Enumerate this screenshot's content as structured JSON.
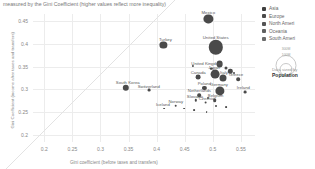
{
  "subtitle": "measured by the Gini Coefficient (higher values reflect more inequality)",
  "axes": {
    "xlabel": "Gini coefficient (before taxes and transfers)",
    "ylabel": "Gini Coefficient (income after taxes and transfers)",
    "xticks": [
      "0.2",
      "0.25",
      "0.3",
      "0.35",
      "0.4",
      "0.45",
      "0.5",
      "0.55"
    ],
    "yticks": [
      "0.2",
      "0.25",
      "0.3",
      "0.35",
      "0.4",
      "0.45"
    ],
    "xlim": [
      0.18,
      0.575
    ],
    "ylim": [
      0.185,
      0.465
    ]
  },
  "legend": {
    "title": "",
    "items": [
      {
        "label": "Asia",
        "color": "#3f3f3f"
      },
      {
        "label": "Europe",
        "color": "#4a4a4a"
      },
      {
        "label": "North Ameri",
        "color": "#555555"
      },
      {
        "label": "Oceania",
        "color": "#606060"
      },
      {
        "label": "South Ameri",
        "color": "#6b6b6b"
      }
    ],
    "size_caption_1": "Data sized by",
    "size_caption_2": "Population",
    "size_values": [
      "300M",
      "100M"
    ]
  },
  "chart_data": {
    "type": "scatter",
    "title": "",
    "subtitle": "measured by the Gini Coefficient (higher values reflect more inequality)",
    "xlabel": "Gini coefficient (before taxes and transfers)",
    "ylabel": "Gini Coefficient (income after taxes and transfers)",
    "xlim": [
      0.18,
      0.575
    ],
    "ylim": [
      0.185,
      0.465
    ],
    "grid": true,
    "size_encodes": "Population",
    "reference_line": "y = x diagonal",
    "points": [
      {
        "name": "Mexico",
        "x": 0.492,
        "y": 0.455,
        "r": 4.6,
        "lx": 0,
        "ly": -6.5
      },
      {
        "name": "United States",
        "x": 0.505,
        "y": 0.392,
        "r": 7.2,
        "lx": 0,
        "ly": -10.5
      },
      {
        "name": "Turkey",
        "x": 0.412,
        "y": 0.397,
        "r": 3.6,
        "lx": 2,
        "ly": -6
      },
      {
        "name": "United Kingdom",
        "x": 0.512,
        "y": 0.355,
        "r": 3.4,
        "lx": -13,
        "ly": -1.5
      },
      {
        "name": "Japan",
        "x": 0.504,
        "y": 0.334,
        "r": 4.4,
        "lx": -1,
        "ly": -6.5
      },
      {
        "name": "Italy",
        "x": 0.518,
        "y": 0.326,
        "r": 3.5,
        "lx": 1,
        "ly": -5.5
      },
      {
        "name": "Canada",
        "x": 0.474,
        "y": 0.327,
        "r": 2.4,
        "lx": 0,
        "ly": -5
      },
      {
        "name": "South Korea",
        "x": 0.345,
        "y": 0.304,
        "r": 3.2,
        "lx": 2,
        "ly": -5.5
      },
      {
        "name": "Switzerland",
        "x": 0.386,
        "y": 0.298,
        "r": 1.4,
        "lx": 0,
        "ly": -4.5
      },
      {
        "name": "Poland",
        "x": 0.485,
        "y": 0.303,
        "r": 2.1,
        "lx": 0,
        "ly": -5
      },
      {
        "name": "Germany",
        "x": 0.513,
        "y": 0.297,
        "r": 4.6,
        "lx": -1,
        "ly": -7
      },
      {
        "name": "Netherlands",
        "x": 0.476,
        "y": 0.288,
        "r": 1.8,
        "lx": 0,
        "ly": -4.8
      },
      {
        "name": "Slovakia",
        "x": 0.47,
        "y": 0.276,
        "r": 1.2,
        "lx": -1,
        "ly": -4.5
      },
      {
        "name": "Czechia",
        "x": 0.487,
        "y": 0.271,
        "r": 1.4,
        "lx": 1,
        "ly": -4.5
      },
      {
        "name": "Belgium",
        "x": 0.503,
        "y": 0.277,
        "r": 1.8,
        "lx": 1,
        "ly": -4.8
      },
      {
        "name": "Norway",
        "x": 0.434,
        "y": 0.264,
        "r": 1.3,
        "lx": 0,
        "ly": -4.5
      },
      {
        "name": "Iceland",
        "x": 0.413,
        "y": 0.258,
        "r": 0.9,
        "lx": -1,
        "ly": -4.2
      },
      {
        "name": "Greece",
        "x": 0.545,
        "y": 0.322,
        "r": 1.8,
        "lx": -2,
        "ly": -5
      },
      {
        "name": "Ireland",
        "x": 0.558,
        "y": 0.295,
        "r": 1.4,
        "lx": -2,
        "ly": -4.8
      },
      {
        "name": "",
        "x": 0.464,
        "y": 0.352,
        "r": 1.1,
        "lx": 0,
        "ly": 0
      },
      {
        "name": "",
        "x": 0.524,
        "y": 0.346,
        "r": 1.5,
        "lx": 0,
        "ly": 0
      },
      {
        "name": "",
        "x": 0.531,
        "y": 0.34,
        "r": 2.2,
        "lx": 0,
        "ly": 0
      },
      {
        "name": "",
        "x": 0.497,
        "y": 0.345,
        "r": 1.2,
        "lx": 0,
        "ly": 0
      },
      {
        "name": "",
        "x": 0.492,
        "y": 0.282,
        "r": 1.0,
        "lx": 0,
        "ly": 0
      },
      {
        "name": "",
        "x": 0.506,
        "y": 0.264,
        "r": 1.0,
        "lx": 0,
        "ly": 0
      },
      {
        "name": "",
        "x": 0.449,
        "y": 0.258,
        "r": 0.9,
        "lx": 0,
        "ly": 0
      },
      {
        "name": "",
        "x": 0.466,
        "y": 0.254,
        "r": 0.9,
        "lx": 0,
        "ly": 0
      },
      {
        "name": "",
        "x": 0.489,
        "y": 0.251,
        "r": 0.9,
        "lx": 0,
        "ly": 0
      },
      {
        "name": "",
        "x": 0.524,
        "y": 0.262,
        "r": 0.9,
        "lx": 0,
        "ly": 0
      },
      {
        "name": "",
        "x": 0.538,
        "y": 0.337,
        "r": 1.0,
        "lx": 0,
        "ly": 0
      }
    ]
  }
}
